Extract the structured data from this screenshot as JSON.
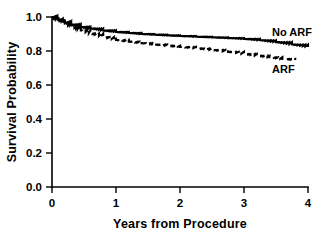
{
  "chart_data": {
    "type": "line",
    "title": "",
    "subtitle": "",
    "xlabel": "Years from Procedure",
    "ylabel": "Survival Probability",
    "xlim": [
      0,
      4
    ],
    "ylim": [
      0.0,
      1.0
    ],
    "xticks": [
      0,
      1,
      2,
      3,
      4
    ],
    "xtick_labels": [
      "0",
      "1",
      "2",
      "3",
      "4"
    ],
    "yticks": [
      0.0,
      0.2,
      0.4,
      0.6,
      0.8,
      1.0
    ],
    "ytick_labels": [
      "0.0",
      "0.2",
      "0.4",
      "0.6",
      "0.8",
      "1.0"
    ],
    "grid": false,
    "legend_position": "inline-right-of-curves",
    "annotations": [
      {
        "text": "No ARF",
        "x": 3.75,
        "y": 0.875
      },
      {
        "text": "ARF",
        "x": 3.72,
        "y": 0.675
      }
    ],
    "series": [
      {
        "name": "No ARF",
        "style": "solid",
        "color": "#000000",
        "x": [
          0.0,
          0.1,
          0.2,
          0.3,
          0.45,
          0.6,
          0.8,
          1.0,
          1.2,
          1.4,
          1.6,
          1.8,
          2.0,
          2.25,
          2.5,
          2.75,
          3.0,
          3.25,
          3.5,
          3.75,
          4.0
        ],
        "y": [
          1.0,
          0.985,
          0.968,
          0.955,
          0.941,
          0.932,
          0.921,
          0.912,
          0.906,
          0.9,
          0.896,
          0.892,
          0.888,
          0.884,
          0.88,
          0.876,
          0.871,
          0.863,
          0.852,
          0.838,
          0.824
        ]
      },
      {
        "name": "ARF",
        "style": "dashed",
        "color": "#000000",
        "x": [
          0.0,
          0.1,
          0.2,
          0.3,
          0.45,
          0.6,
          0.8,
          1.0,
          1.2,
          1.4,
          1.6,
          1.8,
          2.0,
          2.25,
          2.5,
          2.75,
          3.0,
          3.2,
          3.4,
          3.6,
          3.8
        ],
        "y": [
          1.0,
          0.981,
          0.961,
          0.944,
          0.921,
          0.903,
          0.882,
          0.865,
          0.855,
          0.846,
          0.838,
          0.831,
          0.824,
          0.815,
          0.806,
          0.795,
          0.782,
          0.772,
          0.763,
          0.753,
          0.747
        ]
      }
    ]
  },
  "labels": {
    "ylabel": "Survival Probability",
    "xlabel": "Years from Procedure",
    "series_no_arf": "No ARF",
    "series_arf": "ARF"
  }
}
